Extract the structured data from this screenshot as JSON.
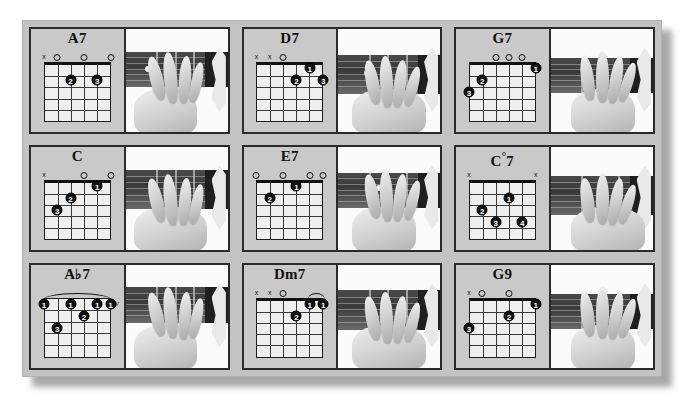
{
  "page": {
    "background_color": "#ffffff",
    "plate_color": "#c3c3c3",
    "cell_border_color": "#2b2b2b",
    "diagram_background": "#efefef",
    "dot_color": "#111111"
  },
  "legend": {
    "muted_symbol": "x",
    "open_symbol": "o",
    "position_marker_label": "IV"
  },
  "grid": {
    "rows": 3,
    "columns": 3,
    "strings": 6,
    "frets": 5
  },
  "chords": [
    {
      "name": "A7",
      "name_root": "A",
      "name_accidental": "",
      "name_quality": "7",
      "position_label": "",
      "markers": [
        "x",
        "o",
        "",
        "o",
        "",
        "o"
      ],
      "dots": [
        {
          "string": 4,
          "fret": 2,
          "finger": "2"
        },
        {
          "string": 2,
          "fret": 2,
          "finger": "3"
        }
      ],
      "barre": null
    },
    {
      "name": "D7",
      "name_root": "D",
      "name_accidental": "",
      "name_quality": "7",
      "position_label": "",
      "markers": [
        "x",
        "x",
        "o",
        "",
        "",
        ""
      ],
      "dots": [
        {
          "string": 2,
          "fret": 1,
          "finger": "1"
        },
        {
          "string": 3,
          "fret": 2,
          "finger": "2"
        },
        {
          "string": 1,
          "fret": 2,
          "finger": "3"
        }
      ],
      "barre": null
    },
    {
      "name": "G7",
      "name_root": "G",
      "name_accidental": "",
      "name_quality": "7",
      "position_label": "",
      "markers": [
        "",
        "",
        "o",
        "o",
        "o",
        ""
      ],
      "dots": [
        {
          "string": 1,
          "fret": 1,
          "finger": "1"
        },
        {
          "string": 5,
          "fret": 2,
          "finger": "2"
        },
        {
          "string": 6,
          "fret": 3,
          "finger": "3"
        }
      ],
      "barre": null
    },
    {
      "name": "C",
      "name_root": "C",
      "name_accidental": "",
      "name_quality": "",
      "position_label": "",
      "markers": [
        "x",
        "",
        "",
        "o",
        "",
        "o"
      ],
      "dots": [
        {
          "string": 2,
          "fret": 1,
          "finger": "1"
        },
        {
          "string": 4,
          "fret": 2,
          "finger": "2"
        },
        {
          "string": 5,
          "fret": 3,
          "finger": "3"
        }
      ],
      "barre": null
    },
    {
      "name": "E7",
      "name_root": "E",
      "name_accidental": "",
      "name_quality": "7",
      "position_label": "",
      "markers": [
        "o",
        "",
        "o",
        "",
        "o",
        "o"
      ],
      "dots": [
        {
          "string": 3,
          "fret": 1,
          "finger": "1"
        },
        {
          "string": 5,
          "fret": 2,
          "finger": "2"
        }
      ],
      "barre": null
    },
    {
      "name": "C°7",
      "name_root": "C",
      "name_accidental": "°",
      "name_quality": "7",
      "position_label": "",
      "markers": [
        "x",
        "",
        "",
        "",
        "",
        "x"
      ],
      "dots": [
        {
          "string": 3,
          "fret": 2,
          "finger": "1"
        },
        {
          "string": 5,
          "fret": 3,
          "finger": "2"
        },
        {
          "string": 4,
          "fret": 4,
          "finger": "3"
        },
        {
          "string": 2,
          "fret": 4,
          "finger": "4"
        }
      ],
      "barre": null
    },
    {
      "name": "A♭7",
      "name_root": "A",
      "name_accidental": "♭",
      "name_quality": "7",
      "position_label": "IV",
      "markers": [
        "",
        "",
        "",
        "",
        "",
        ""
      ],
      "dots": [
        {
          "string": 6,
          "fret": 1,
          "finger": "1"
        },
        {
          "string": 4,
          "fret": 1,
          "finger": "1"
        },
        {
          "string": 2,
          "fret": 1,
          "finger": "1"
        },
        {
          "string": 1,
          "fret": 1,
          "finger": "1"
        },
        {
          "string": 3,
          "fret": 2,
          "finger": "2"
        },
        {
          "string": 5,
          "fret": 3,
          "finger": "3"
        }
      ],
      "barre": {
        "fret": 1,
        "from_string": 6,
        "to_string": 1
      }
    },
    {
      "name": "Dm7",
      "name_root": "Dm",
      "name_accidental": "",
      "name_quality": "7",
      "position_label": "",
      "markers": [
        "x",
        "x",
        "o",
        "",
        "",
        ""
      ],
      "dots": [
        {
          "string": 2,
          "fret": 1,
          "finger": "1"
        },
        {
          "string": 1,
          "fret": 1,
          "finger": "1"
        },
        {
          "string": 3,
          "fret": 2,
          "finger": "2"
        }
      ],
      "barre": {
        "fret": 1,
        "from_string": 2,
        "to_string": 1
      }
    },
    {
      "name": "G9",
      "name_root": "G",
      "name_accidental": "",
      "name_quality": "9",
      "position_label": "",
      "markers": [
        "x",
        "o",
        "",
        "o",
        "",
        ""
      ],
      "dots": [
        {
          "string": 1,
          "fret": 1,
          "finger": "1"
        },
        {
          "string": 3,
          "fret": 2,
          "finger": "2"
        },
        {
          "string": 6,
          "fret": 3,
          "finger": "3"
        }
      ],
      "barre": null
    }
  ],
  "photos": [
    {
      "alt": "hand-position-a7",
      "inlay": true,
      "inlay_x": 22,
      "inlay_y": 48
    },
    {
      "alt": "hand-position-d7",
      "inlay": true,
      "inlay_x": 28,
      "inlay_y": 46
    },
    {
      "alt": "hand-position-g7",
      "inlay": false,
      "inlay_x": 0,
      "inlay_y": 0
    },
    {
      "alt": "hand-position-c",
      "inlay": false,
      "inlay_x": 0,
      "inlay_y": 0
    },
    {
      "alt": "hand-position-e7",
      "inlay": true,
      "inlay_x": 40,
      "inlay_y": 44
    },
    {
      "alt": "hand-position-c-dim7",
      "inlay": false,
      "inlay_x": 0,
      "inlay_y": 0
    },
    {
      "alt": "hand-position-ab7",
      "inlay": true,
      "inlay_x": 42,
      "inlay_y": 42
    },
    {
      "alt": "hand-position-dm7",
      "inlay": true,
      "inlay_x": 48,
      "inlay_y": 45
    },
    {
      "alt": "hand-position-g9",
      "inlay": false,
      "inlay_x": 0,
      "inlay_y": 0
    }
  ]
}
